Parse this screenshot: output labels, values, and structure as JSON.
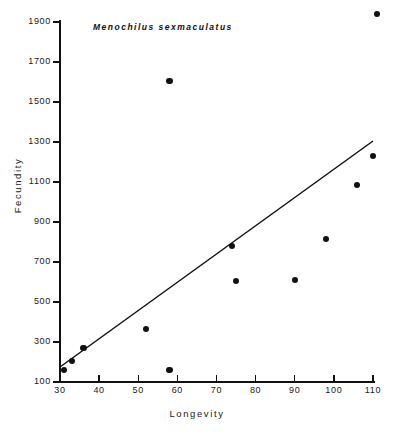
{
  "chart_data": {
    "type": "scatter",
    "title": "Menochilus sexmaculatus",
    "xlabel": "Longevity",
    "ylabel": "Fecundity",
    "xlim": [
      30,
      110
    ],
    "ylim": [
      100,
      1900
    ],
    "xticks": [
      30,
      40,
      50,
      60,
      70,
      80,
      90,
      100,
      110
    ],
    "yticks": [
      100,
      300,
      500,
      700,
      900,
      1100,
      1300,
      1500,
      1700,
      1900
    ],
    "grid": false,
    "legend": null,
    "marker_color": "#111111",
    "line_color": "#111111",
    "points": [
      {
        "x": 31,
        "y": 160
      },
      {
        "x": 33,
        "y": 205
      },
      {
        "x": 36,
        "y": 270
      },
      {
        "x": 52,
        "y": 365
      },
      {
        "x": 58,
        "y": 160
      },
      {
        "x": 58,
        "y": 1605
      },
      {
        "x": 74,
        "y": 780
      },
      {
        "x": 75,
        "y": 605
      },
      {
        "x": 90,
        "y": 610
      },
      {
        "x": 98,
        "y": 815
      },
      {
        "x": 106,
        "y": 1085
      },
      {
        "x": 110,
        "y": 1230
      },
      {
        "x": 111,
        "y": 1940
      }
    ],
    "trend_line": {
      "x0": 30,
      "y0": 175,
      "x1": 110,
      "y1": 1305
    }
  },
  "axis": {
    "x_tick_labels": [
      "30",
      "40",
      "50",
      "60",
      "70",
      "80",
      "90",
      "100",
      "110"
    ],
    "y_tick_labels": [
      "100",
      "300",
      "500",
      "700",
      "900",
      "1100",
      "1300",
      "1500",
      "1700",
      "1900"
    ]
  }
}
